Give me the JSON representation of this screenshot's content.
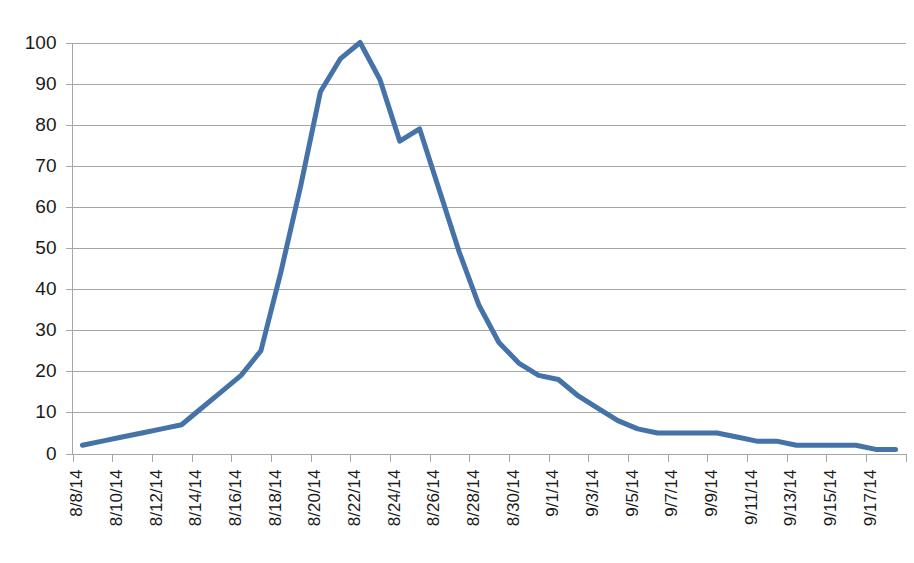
{
  "chart_data": {
    "type": "line",
    "title": "",
    "subtitle": "",
    "xlabel": "",
    "ylabel": "",
    "grid": true,
    "legend": false,
    "legend_position": "none",
    "series_color": "#4572a7",
    "ylim": [
      0,
      100
    ],
    "yticks": [
      0,
      10,
      20,
      30,
      40,
      50,
      60,
      70,
      80,
      90,
      100
    ],
    "ytick_labels": [
      "0",
      "10",
      "20",
      "30",
      "40",
      "50",
      "60",
      "70",
      "80",
      "90",
      "100"
    ],
    "x_tick_label_rotation": -90,
    "x_labeled_ticks": [
      "8/8/14",
      "8/10/14",
      "8/12/14",
      "8/14/14",
      "8/16/14",
      "8/18/14",
      "8/20/14",
      "8/22/14",
      "8/24/14",
      "8/26/14",
      "8/28/14",
      "8/30/14",
      "9/1/14",
      "9/3/14",
      "9/5/14",
      "9/7/14",
      "9/9/14",
      "9/11/14",
      "9/13/14",
      "9/15/14",
      "9/17/14"
    ],
    "x": [
      "8/8/14",
      "8/9/14",
      "8/10/14",
      "8/11/14",
      "8/12/14",
      "8/13/14",
      "8/14/14",
      "8/15/14",
      "8/16/14",
      "8/17/14",
      "8/18/14",
      "8/19/14",
      "8/20/14",
      "8/21/14",
      "8/22/14",
      "8/23/14",
      "8/24/14",
      "8/25/14",
      "8/26/14",
      "8/27/14",
      "8/28/14",
      "8/29/14",
      "8/30/14",
      "8/31/14",
      "9/1/14",
      "9/2/14",
      "9/3/14",
      "9/4/14",
      "9/5/14",
      "9/6/14",
      "9/7/14",
      "9/8/14",
      "9/9/14",
      "9/10/14",
      "9/11/14",
      "9/12/14",
      "9/13/14",
      "9/14/14",
      "9/15/14",
      "9/16/14",
      "9/17/14",
      "9/18/14"
    ],
    "values": [
      2,
      3,
      4,
      5,
      6,
      7,
      11,
      15,
      19,
      25,
      44,
      65,
      88,
      96,
      100,
      91,
      76,
      79,
      64,
      49,
      36,
      27,
      22,
      19,
      18,
      14,
      11,
      8,
      6,
      5,
      5,
      5,
      5,
      4,
      3,
      3,
      2,
      2,
      2,
      2,
      1,
      1
    ],
    "series": [
      {
        "name": "Series 1",
        "values": [
          2,
          3,
          4,
          5,
          6,
          7,
          11,
          15,
          19,
          25,
          44,
          65,
          88,
          96,
          100,
          91,
          76,
          79,
          64,
          49,
          36,
          27,
          22,
          19,
          18,
          14,
          11,
          8,
          6,
          5,
          5,
          5,
          5,
          4,
          3,
          3,
          2,
          2,
          2,
          2,
          1,
          1
        ]
      }
    ]
  }
}
